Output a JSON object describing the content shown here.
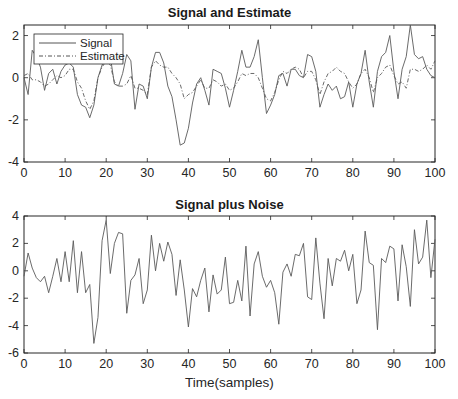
{
  "chart_data": [
    {
      "type": "line",
      "title": "Signal and Estimate",
      "xlabel": "",
      "ylabel": "",
      "xlim": [
        0,
        100
      ],
      "ylim": [
        -4,
        2.5
      ],
      "xticks": [
        0,
        10,
        20,
        30,
        40,
        50,
        60,
        70,
        80,
        90,
        100
      ],
      "yticks": [
        -4,
        -2,
        0,
        2
      ],
      "grid": false,
      "legend": {
        "position": "upper-left",
        "entries": [
          "Signal",
          "Estimate"
        ]
      },
      "series": [
        {
          "name": "Signal",
          "style": "solid",
          "values": [
            0.0,
            -0.8,
            1.3,
            1.0,
            0.5,
            -0.6,
            0.2,
            0.4,
            -0.3,
            0.3,
            0.6,
            0.7,
            0.5,
            -0.8,
            -1.3,
            -1.4,
            -1.9,
            -1.3,
            0.0,
            0.6,
            1.0,
            1.0,
            -0.3,
            -0.4,
            0.2,
            1.1,
            0.8,
            -1.5,
            -0.3,
            -0.4,
            -1.0,
            0.5,
            1.2,
            1.2,
            0.7,
            -0.4,
            -0.9,
            -2.0,
            -3.2,
            -3.1,
            -2.4,
            -1.2,
            -0.3,
            0.0,
            -0.6,
            -1.3,
            0.4,
            0.3,
            0.2,
            -0.5,
            -1.4,
            -0.6,
            0.3,
            1.3,
            0.5,
            0.5,
            1.0,
            1.8,
            0.0,
            -1.7,
            -1.3,
            -0.8,
            0.1,
            0.2,
            -0.4,
            0.4,
            0.4,
            0.1,
            0.0,
            1.1,
            1.0,
            0.3,
            -1.4,
            -0.8,
            -0.3,
            -0.6,
            -0.4,
            -1.0,
            -0.9,
            -0.2,
            -1.4,
            -0.3,
            0.2,
            1.3,
            -0.2,
            -1.4,
            0.3,
            1.0,
            1.2,
            2.0,
            0.3,
            -1.0,
            0.4,
            1.0,
            2.5,
            1.1,
            0.9,
            1.0,
            0.4,
            0.1,
            0.0
          ]
        },
        {
          "name": "Estimate",
          "style": "dash-dot",
          "values": [
            0.1,
            0.2,
            -0.1,
            -0.1,
            -0.2,
            -0.4,
            -0.3,
            -0.1,
            0.1,
            0.0,
            0.1,
            0.4,
            0.4,
            -0.2,
            -0.5,
            -1.1,
            -1.5,
            -1.1,
            0.0,
            0.5,
            0.8,
            0.6,
            -0.2,
            -0.4,
            -0.4,
            -0.3,
            0.1,
            -0.5,
            -0.5,
            -0.6,
            -0.8,
            0.5,
            0.8,
            0.6,
            0.5,
            0.5,
            0.2,
            0.0,
            -0.3,
            -1.0,
            -0.8,
            -0.7,
            -0.4,
            -0.1,
            -0.5,
            -0.5,
            -0.1,
            -0.2,
            -0.4,
            -0.3,
            -0.6,
            -0.5,
            -0.2,
            0.2,
            0.1,
            0.2,
            0.2,
            0.0,
            -0.5,
            -1.0,
            -1.1,
            -0.7,
            -0.1,
            0.3,
            0.2,
            0.4,
            0.5,
            0.4,
            0.0,
            0.3,
            0.3,
            -0.1,
            -0.8,
            -0.2,
            0.2,
            0.3,
            0.5,
            0.3,
            0.2,
            -0.2,
            -0.5,
            -0.3,
            0.2,
            0.4,
            0.0,
            -0.7,
            0.0,
            0.2,
            0.5,
            0.6,
            0.1,
            -0.3,
            -0.2,
            -0.5,
            0.4,
            0.4,
            0.3,
            0.4,
            0.6,
            0.4,
            0.8
          ]
        }
      ]
    },
    {
      "type": "line",
      "title": "Signal plus Noise",
      "xlabel": "Time(samples)",
      "ylabel": "",
      "xlim": [
        0,
        100
      ],
      "ylim": [
        -6,
        4
      ],
      "xticks": [
        0,
        10,
        20,
        30,
        40,
        50,
        60,
        70,
        80,
        90,
        100
      ],
      "yticks": [
        -6,
        -4,
        -2,
        0,
        2,
        4
      ],
      "grid": false,
      "series": [
        {
          "name": "Signal plus Noise",
          "style": "solid",
          "values": [
            -0.4,
            1.3,
            0.2,
            -0.5,
            -0.8,
            -0.4,
            -1.6,
            -0.4,
            0.9,
            -0.8,
            1.4,
            -0.8,
            2.2,
            -1.6,
            1.4,
            -1.6,
            -1.0,
            -5.3,
            -3.4,
            2.2,
            3.7,
            -0.2,
            2.0,
            2.8,
            2.7,
            -3.1,
            -0.7,
            -0.3,
            0.9,
            -2.4,
            -1.4,
            2.6,
            0.0,
            2.0,
            0.7,
            2.1,
            1.2,
            -1.8,
            0.8,
            -1.4,
            -4.1,
            -1.3,
            -1.9,
            -0.7,
            0.2,
            -3.0,
            -0.3,
            -1.7,
            -1.4,
            1.0,
            -2.4,
            -2.3,
            -0.7,
            -2.2,
            1.8,
            -3.3,
            0.5,
            1.4,
            -0.4,
            -1.2,
            -0.7,
            -1.6,
            -3.9,
            -0.1,
            0.5,
            -0.4,
            1.2,
            1.1,
            2.0,
            -1.9,
            -2.1,
            2.4,
            -0.9,
            -3.5,
            0.9,
            -1.1,
            0.9,
            0.7,
            1.5,
            0.0,
            1.2,
            -2.4,
            -1.4,
            2.9,
            0.6,
            0.4,
            -4.3,
            0.9,
            0.6,
            1.8,
            1.6,
            -2.2,
            1.9,
            0.3,
            -2.6,
            3.0,
            0.5,
            1.0,
            3.7,
            -0.5,
            2.3
          ]
        }
      ]
    }
  ]
}
